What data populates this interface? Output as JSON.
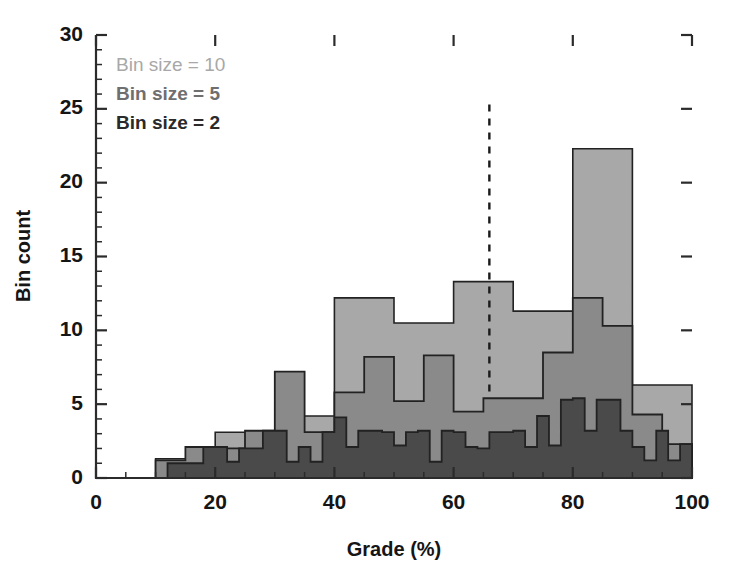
{
  "chart_data": {
    "type": "bar",
    "title": "",
    "xlabel": "Grade (%)",
    "ylabel": "Bin count",
    "xlim": [
      0,
      100
    ],
    "ylim": [
      0,
      30
    ],
    "xticks": [
      0,
      20,
      40,
      60,
      80,
      100
    ],
    "yticks": [
      0,
      5,
      10,
      15,
      20,
      25,
      30
    ],
    "x_minor_step": 5,
    "y_minor_step": 1,
    "grid": false,
    "legend_position": "top-left",
    "series": [
      {
        "name": "Bin size = 10",
        "bin_width": 10,
        "color": "#a8a8a8",
        "bin_edges": [
          0,
          10,
          20,
          30,
          40,
          50,
          60,
          70,
          80,
          90,
          100
        ],
        "values": [
          0,
          1.3,
          3.1,
          4.2,
          12.2,
          10.5,
          13.3,
          11.3,
          22.3,
          6.3
        ]
      },
      {
        "name": "Bin size = 5",
        "bin_width": 5,
        "color": "#8a8a8a",
        "bin_edges": [
          0,
          5,
          10,
          15,
          20,
          25,
          30,
          35,
          40,
          45,
          50,
          55,
          60,
          65,
          70,
          75,
          80,
          85,
          90,
          95,
          100
        ],
        "values": [
          0,
          0,
          1.2,
          2.1,
          2.0,
          3.2,
          7.2,
          3.1,
          5.8,
          8.2,
          5.2,
          8.3,
          4.5,
          5.4,
          5.4,
          8.5,
          12.2,
          10.3,
          4.3,
          2.3
        ]
      },
      {
        "name": "Bin size = 2",
        "bin_width": 2,
        "color": "#4a4a4a",
        "bin_edges": [
          0,
          2,
          4,
          6,
          8,
          10,
          12,
          14,
          16,
          18,
          20,
          22,
          24,
          26,
          28,
          30,
          32,
          34,
          36,
          38,
          40,
          42,
          44,
          46,
          48,
          50,
          52,
          54,
          56,
          58,
          60,
          62,
          64,
          66,
          68,
          70,
          72,
          74,
          76,
          78,
          80,
          82,
          84,
          86,
          88,
          90,
          92,
          94,
          96,
          98,
          100
        ],
        "values": [
          0,
          0,
          0,
          0,
          0,
          0,
          1.0,
          1.0,
          1.0,
          2.1,
          2.1,
          1.1,
          2.0,
          2.0,
          3.2,
          3.2,
          1.1,
          2.1,
          1.1,
          3.1,
          4.1,
          2.1,
          3.2,
          3.2,
          3.1,
          2.2,
          3.1,
          3.2,
          1.1,
          3.2,
          3.1,
          2.1,
          2.0,
          3.1,
          3.1,
          3.2,
          2.1,
          4.2,
          2.2,
          5.3,
          5.4,
          3.2,
          5.3,
          5.3,
          3.2,
          2.1,
          1.2,
          3.2,
          1.2,
          2.3
        ]
      }
    ],
    "annotations": [
      {
        "type": "vertical-dashed-line",
        "x": 66,
        "y_start": 5.8,
        "y_end": 25.3,
        "color": "#1a1a1a"
      }
    ]
  },
  "legend": {
    "items": [
      {
        "label": "Bin size = 10",
        "color": "#a8a8a8",
        "weight": "400"
      },
      {
        "label": "Bin size = 5",
        "color": "#6f6f6f",
        "weight": "600"
      },
      {
        "label": "Bin size = 2",
        "color": "#2a2a2a",
        "weight": "700"
      }
    ]
  },
  "axes": {
    "x_title": "Grade (%)",
    "y_title": "Bin count",
    "x_tick_labels": [
      "0",
      "20",
      "40",
      "60",
      "80",
      "100"
    ],
    "y_tick_labels": [
      "0",
      "5",
      "10",
      "15",
      "20",
      "25",
      "30"
    ]
  }
}
